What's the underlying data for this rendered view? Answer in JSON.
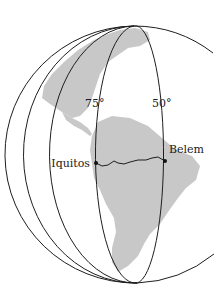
{
  "figure": {
    "type": "globe-meridians-diagram",
    "colors": {
      "background": "#ffffff",
      "land": "#c8c8c8",
      "lines": "#1e1e1e"
    },
    "meridian_labels": [
      {
        "text": "75°",
        "x": 94,
        "y": 107
      },
      {
        "text": "50°",
        "x": 161,
        "y": 107
      }
    ],
    "cities": [
      {
        "name": "Iquitos",
        "dot_x": 96,
        "dot_y": 163,
        "label_x": 90,
        "label_y": 167,
        "anchor": "end"
      },
      {
        "name": "Belem",
        "dot_x": 165,
        "dot_y": 161,
        "label_x": 169,
        "label_y": 152,
        "anchor": "start"
      }
    ]
  }
}
